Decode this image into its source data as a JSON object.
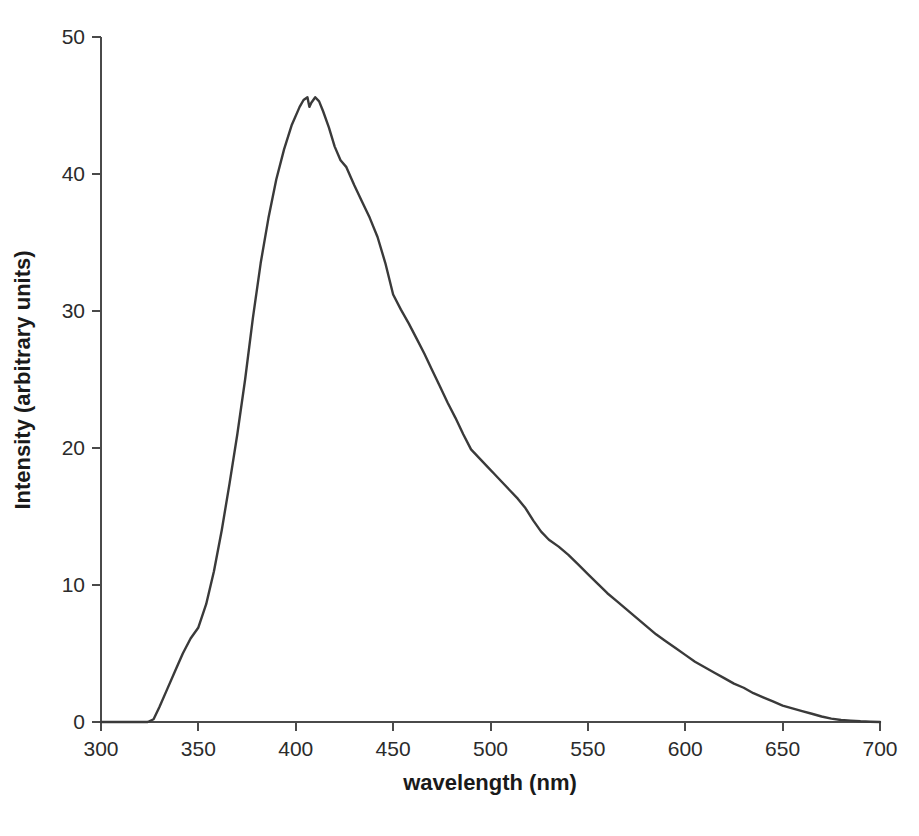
{
  "chart_data": {
    "type": "line",
    "title": "",
    "subtitle": "",
    "xlabel": "wavelength (nm)",
    "ylabel": "Intensity (arbitrary units)",
    "xlim": [
      300,
      700
    ],
    "ylim": [
      0,
      50
    ],
    "xticks": [
      300,
      350,
      400,
      450,
      500,
      550,
      600,
      650,
      700
    ],
    "xtick_labels": [
      "300",
      "350",
      "400",
      "450",
      "500",
      "550",
      "600",
      "650",
      "700"
    ],
    "yticks": [
      0,
      10,
      20,
      30,
      40,
      50
    ],
    "ytick_labels": [
      "0",
      "10",
      "20",
      "30",
      "40",
      "50"
    ],
    "grid": false,
    "legend": null,
    "legend_position": "none",
    "line_color": "#3a3a3a",
    "line_width": 2.4,
    "annotations": [],
    "series": [
      {
        "name": "emission spectrum",
        "x": [
          300,
          305,
          310,
          315,
          320,
          324,
          327,
          330,
          334,
          338,
          342,
          346,
          350,
          354,
          358,
          362,
          366,
          370,
          374,
          378,
          382,
          386,
          390,
          394,
          398,
          402,
          404,
          406,
          407,
          408,
          410,
          412,
          414,
          417,
          420,
          423,
          426,
          430,
          434,
          438,
          442,
          446,
          450,
          454,
          458,
          462,
          466,
          470,
          474,
          478,
          482,
          486,
          490,
          494,
          498,
          502,
          506,
          510,
          514,
          518,
          522,
          526,
          530,
          535,
          540,
          545,
          550,
          555,
          560,
          565,
          570,
          575,
          580,
          585,
          590,
          595,
          600,
          605,
          610,
          615,
          620,
          625,
          630,
          635,
          640,
          645,
          650,
          655,
          660,
          665,
          670,
          675,
          680,
          685,
          690,
          695,
          700
        ],
        "y": [
          0.0,
          0.0,
          0.0,
          0.0,
          0.0,
          0.0,
          0.2,
          1.1,
          2.4,
          3.7,
          5.0,
          6.1,
          6.9,
          8.6,
          11.0,
          14.0,
          17.4,
          21.0,
          25.0,
          29.5,
          33.5,
          36.8,
          39.6,
          41.8,
          43.6,
          44.9,
          45.4,
          45.6,
          44.9,
          45.2,
          45.6,
          45.3,
          44.6,
          43.4,
          42.0,
          41.0,
          40.5,
          39.2,
          38.0,
          36.8,
          35.4,
          33.5,
          31.2,
          30.1,
          29.1,
          28.0,
          26.9,
          25.7,
          24.5,
          23.3,
          22.2,
          21.0,
          19.9,
          19.3,
          18.7,
          18.1,
          17.5,
          16.9,
          16.3,
          15.6,
          14.7,
          13.9,
          13.3,
          12.8,
          12.2,
          11.5,
          10.8,
          10.1,
          9.4,
          8.8,
          8.2,
          7.6,
          7.0,
          6.4,
          5.9,
          5.4,
          4.9,
          4.4,
          4.0,
          3.6,
          3.2,
          2.8,
          2.5,
          2.1,
          1.8,
          1.5,
          1.2,
          1.0,
          0.8,
          0.6,
          0.4,
          0.25,
          0.15,
          0.1,
          0.05,
          0.02,
          0.0
        ]
      }
    ]
  }
}
